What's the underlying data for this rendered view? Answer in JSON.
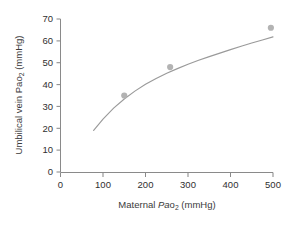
{
  "chart_data": {
    "type": "line",
    "title": "",
    "subtitle": "",
    "xlabel_parts": {
      "pre": "Maternal ",
      "italic": "Pa",
      "roman": "o",
      "subscript": "2",
      "post": " (mmHg)"
    },
    "ylabel_parts": {
      "pre": "Umbilical vein Pa",
      "italic": "",
      "roman": "o",
      "subscript": "2",
      "post": " (mmHg)"
    },
    "xlabel": "Maternal Pao2 (mmHg)",
    "ylabel": "Umbilical vein Pao2 (mmHg)",
    "xlim": [
      0,
      500
    ],
    "ylim": [
      0,
      70
    ],
    "xticks": [
      0,
      100,
      200,
      300,
      400,
      500
    ],
    "xtick_labels": [
      "0",
      "100",
      "200",
      "300",
      "400",
      "500"
    ],
    "yticks": [
      0,
      10,
      20,
      30,
      40,
      50,
      60,
      70
    ],
    "ytick_labels": [
      "0",
      "10",
      "20",
      "30",
      "40",
      "50",
      "60",
      "70"
    ],
    "grid": false,
    "legend": false,
    "legend_position": "none",
    "series": [
      {
        "name": "Umbilical vein Pao2 vs Maternal Pao2",
        "kind": "scatter",
        "marker": "circle",
        "color": "#b3b3b3",
        "x": [
          150,
          258,
          495
        ],
        "y": [
          35,
          48,
          66
        ]
      },
      {
        "name": "Fitted curve",
        "kind": "line",
        "color": "#9a9a9a",
        "x": [
          78,
          100,
          125,
          150,
          175,
          200,
          225,
          250,
          275,
          300,
          325,
          350,
          375,
          400,
          425,
          450,
          475,
          500
        ],
        "y": [
          19.0,
          24.2,
          29.2,
          33.4,
          37.0,
          40.1,
          42.8,
          45.2,
          47.3,
          49.3,
          51.1,
          52.8,
          54.4,
          56.0,
          57.5,
          59.0,
          60.4,
          61.8
        ]
      }
    ],
    "annotations": []
  },
  "colors": {
    "axis": "#8a8a8a",
    "curve": "#9a9a9a",
    "marker": "#b3b3b3",
    "text": "#2f2f2f",
    "background": "#ffffff"
  }
}
